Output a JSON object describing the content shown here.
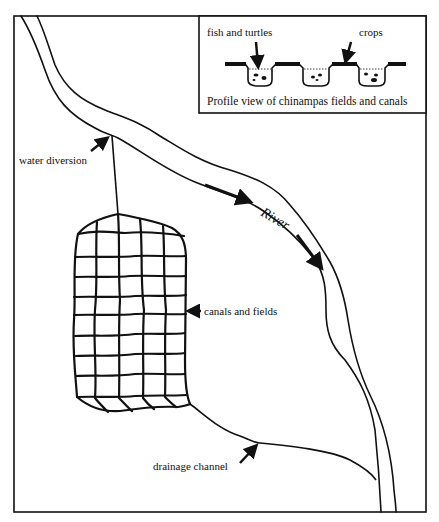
{
  "diagram": {
    "river_label": "River",
    "labels": {
      "water_diversion": "water diversion",
      "canals_and_fields": "canals and fields",
      "drainage_channel": "drainage channel"
    },
    "inset": {
      "caption": "Profile view of chinampas fields and canals",
      "label_fish": "fish and turtles",
      "label_crops": "crops"
    },
    "colors": {
      "ink": "#111111",
      "paper": "#ffffff"
    }
  }
}
